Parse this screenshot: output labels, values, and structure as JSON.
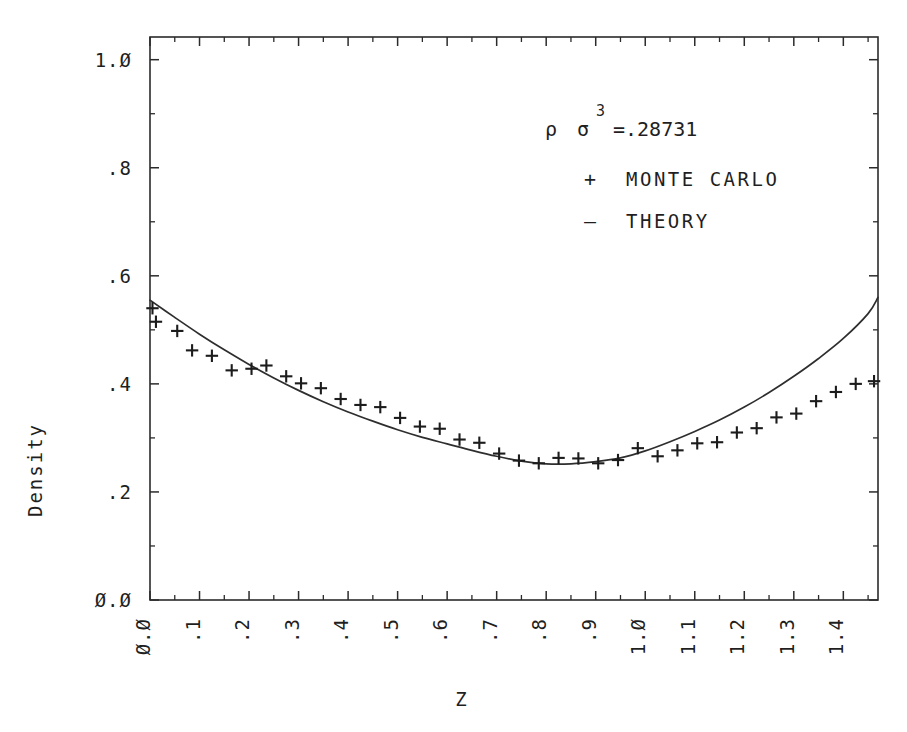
{
  "figure": {
    "background_color": "#ffffff",
    "ink_color": "#2b2b2b",
    "xlabel": "Z",
    "ylabel": "Density"
  },
  "annotation": {
    "rho_symbol": "ρ",
    "sigma_symbol": "σ",
    "exponent": "3",
    "equals_value": "=.28731",
    "full_text": "ρ σ³ =.28731"
  },
  "legend": {
    "position": "upper-center-right",
    "entries": [
      {
        "symbol": "+",
        "label": "MONTE CARLO"
      },
      {
        "symbol": "–",
        "label": "THEORY"
      }
    ]
  },
  "axes": {
    "x": {
      "tick_labels": [
        "0.0",
        ".1",
        ".2",
        ".3",
        ".4",
        ".5",
        ".6",
        ".7",
        ".8",
        ".9",
        "1.0",
        "1.1",
        "1.2",
        "1.3",
        "1.4"
      ],
      "tick_values": [
        0.0,
        0.1,
        0.2,
        0.3,
        0.4,
        0.5,
        0.6,
        0.7,
        0.8,
        0.9,
        1.0,
        1.1,
        1.2,
        1.3,
        1.4
      ],
      "label_rotation_deg": -90,
      "minor_tick_step": 0.05,
      "range": [
        0.0,
        1.47
      ]
    },
    "y": {
      "tick_labels": [
        "0.0",
        ".2",
        ".4",
        ".6",
        ".8",
        "1.0"
      ],
      "tick_values": [
        0.0,
        0.2,
        0.4,
        0.6,
        0.8,
        1.0
      ],
      "minor_tick_step": 0.1,
      "range": [
        0.0,
        1.042
      ]
    },
    "grid": false,
    "frame": "all-four-sides-inward-ticks"
  },
  "chart_data": {
    "type": "scatter",
    "title": "",
    "subtitle": "",
    "xlabel": "Z",
    "ylabel": "Density",
    "xlim": [
      0.0,
      1.47
    ],
    "ylim": [
      0.0,
      1.042
    ],
    "grid": false,
    "legend_position": "upper-right",
    "annotations": [
      "ρ σ³ =.28731"
    ],
    "series": [
      {
        "name": "MONTE CARLO",
        "type": "scatter",
        "marker": "+",
        "x": [
          0.005,
          0.012,
          0.055,
          0.085,
          0.125,
          0.165,
          0.205,
          0.235,
          0.275,
          0.305,
          0.345,
          0.385,
          0.425,
          0.465,
          0.505,
          0.545,
          0.585,
          0.625,
          0.665,
          0.705,
          0.745,
          0.785,
          0.825,
          0.865,
          0.905,
          0.945,
          0.985,
          1.025,
          1.065,
          1.105,
          1.145,
          1.185,
          1.225,
          1.265,
          1.305,
          1.345,
          1.385,
          1.425,
          1.462
        ],
        "y": [
          0.54,
          0.515,
          0.498,
          0.462,
          0.452,
          0.425,
          0.428,
          0.434,
          0.414,
          0.401,
          0.392,
          0.372,
          0.361,
          0.357,
          0.337,
          0.321,
          0.317,
          0.297,
          0.291,
          0.271,
          0.258,
          0.253,
          0.263,
          0.262,
          0.253,
          0.259,
          0.281,
          0.266,
          0.277,
          0.29,
          0.292,
          0.31,
          0.318,
          0.338,
          0.345,
          0.368,
          0.385,
          0.4,
          0.405
        ]
      },
      {
        "name": "THEORY",
        "type": "line",
        "x": [
          0.0,
          0.05,
          0.1,
          0.15,
          0.2,
          0.25,
          0.3,
          0.35,
          0.4,
          0.45,
          0.5,
          0.55,
          0.6,
          0.65,
          0.7,
          0.75,
          0.8,
          0.85,
          0.9,
          0.95,
          1.0,
          1.05,
          1.1,
          1.15,
          1.2,
          1.25,
          1.3,
          1.35,
          1.4,
          1.45,
          1.47
        ],
        "y": [
          0.555,
          0.523,
          0.492,
          0.463,
          0.436,
          0.411,
          0.388,
          0.367,
          0.348,
          0.331,
          0.315,
          0.301,
          0.289,
          0.277,
          0.266,
          0.257,
          0.252,
          0.252,
          0.256,
          0.263,
          0.276,
          0.293,
          0.312,
          0.333,
          0.357,
          0.384,
          0.414,
          0.447,
          0.484,
          0.53,
          0.56
        ]
      }
    ]
  },
  "layout": {
    "frame_left_px": 150,
    "frame_right_px": 878,
    "frame_top_px": 37,
    "frame_bottom_px": 600
  }
}
